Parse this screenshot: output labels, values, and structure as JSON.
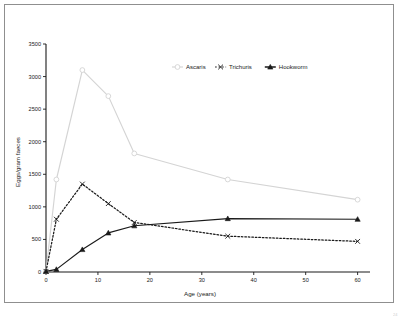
{
  "chart_data": {
    "type": "line",
    "title": "",
    "xlabel": "Age (years)",
    "ylabel": "Eggs/gram faeces",
    "xlim": [
      0,
      62
    ],
    "ylim": [
      0,
      3500
    ],
    "xticks": [
      "0",
      "10",
      "20",
      "30",
      "40",
      "50",
      "60"
    ],
    "yticks": [
      "0",
      "500",
      "1000",
      "1500",
      "2000",
      "2500",
      "3000",
      "3500"
    ],
    "grid": false,
    "legend_position": "top-center",
    "series": [
      {
        "name": "Ascaris",
        "marker": "open-circle",
        "line_style": "solid",
        "color": "#d4d4d4",
        "x": [
          0,
          2,
          7,
          12,
          17,
          35,
          60
        ],
        "values": [
          10,
          1420,
          3100,
          2700,
          1820,
          1420,
          1110
        ]
      },
      {
        "name": "Trichuris",
        "marker": "cross",
        "line_style": "dotted",
        "color": "#1a1a1a",
        "x": [
          0,
          2,
          7,
          12,
          17,
          35,
          60
        ],
        "values": [
          10,
          810,
          1350,
          1050,
          760,
          550,
          470
        ]
      },
      {
        "name": "Hookworm",
        "marker": "triangle",
        "line_style": "solid",
        "color": "#1a1a1a",
        "x": [
          0,
          2,
          7,
          12,
          17,
          35,
          60
        ],
        "values": [
          10,
          40,
          345,
          600,
          710,
          820,
          810
        ]
      }
    ]
  },
  "legend": {
    "items": [
      {
        "label": "Ascaris"
      },
      {
        "label": "Trichuris"
      },
      {
        "label": "Hookworm"
      }
    ]
  },
  "axes": {
    "x_title": "Age (years)",
    "y_title": "Eggs/gram faeces"
  }
}
